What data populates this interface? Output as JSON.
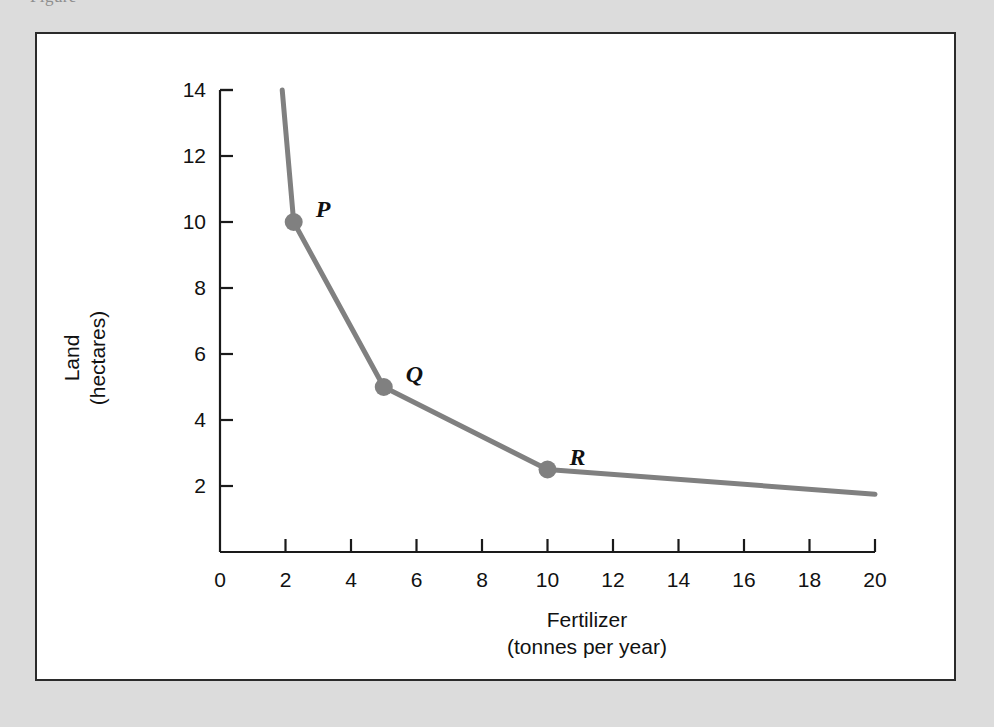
{
  "page": {
    "cut_off_caption": "Figure",
    "background_color": "#dcdcdc",
    "panel_background": "#ffffff",
    "panel_border_color": "#2b2b2b"
  },
  "chart_data": {
    "type": "line",
    "title": "",
    "subtitle": "",
    "xlabel": "Fertilizer",
    "xlabel_units": "(tonnes per year)",
    "ylabel": "Land",
    "ylabel_units": "(hectares)",
    "xlim": [
      0,
      20
    ],
    "ylim": [
      0,
      14
    ],
    "xticks": [
      0,
      2,
      4,
      6,
      8,
      10,
      12,
      14,
      16,
      18,
      20
    ],
    "xtick_labels": [
      "0",
      "2",
      "4",
      "6",
      "8",
      "10",
      "12",
      "14",
      "16",
      "18",
      "20"
    ],
    "yticks": [
      2,
      4,
      6,
      8,
      10,
      12,
      14
    ],
    "ytick_labels": [
      "2",
      "4",
      "6",
      "8",
      "10",
      "12",
      "14"
    ],
    "grid": false,
    "legend": "none",
    "line_color": "#808080",
    "line_width": 5,
    "marker_color": "#808080",
    "marker_radius": 9,
    "axis_color": "#1a1a1a",
    "series": [
      {
        "name": "isoquant",
        "x": [
          1.9,
          2.25,
          5.0,
          10.0,
          20.0
        ],
        "y": [
          14.0,
          10.0,
          5.0,
          2.5,
          1.75
        ]
      }
    ],
    "points": [
      {
        "label": "P",
        "x": 2.25,
        "y": 10.0,
        "label_dx": 22,
        "label_dy": -14
      },
      {
        "label": "Q",
        "x": 5.0,
        "y": 5.0,
        "label_dx": 22,
        "label_dy": -14
      },
      {
        "label": "R",
        "x": 10.0,
        "y": 2.5,
        "label_dx": 22,
        "label_dy": -14
      }
    ],
    "annotations": []
  }
}
